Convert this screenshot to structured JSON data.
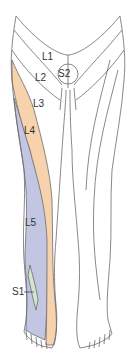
{
  "labels": {
    "l1": "L1",
    "l2": "L2",
    "s2": "S2",
    "l3": "L3",
    "l4": "L4",
    "l5": "L5",
    "s1": "S1"
  },
  "colors": {
    "outline": "#6b6b6b",
    "l4": "#f6d2ad",
    "l5": "#c3c6e3",
    "s1": "#cfe6cf",
    "background": "#ffffff"
  }
}
